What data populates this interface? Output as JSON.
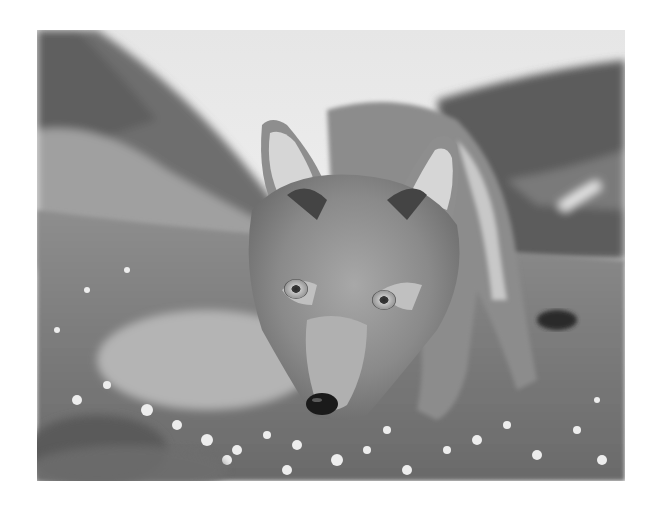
{
  "image": {
    "subject": "arctic fox",
    "alt": "Grayscale close-up photograph of an arctic fox in summer coat walking toward the camera through a meadow of small white flowers, with blurred hills and a bright sky behind",
    "style": "grayscale photograph",
    "colors": {
      "background": "#ffffff",
      "sky": "#f2f2f2",
      "hills_dark": "#5a5a5a",
      "hills_mid": "#8c8c8c",
      "meadow": "#7a7a7a",
      "fur_light": "#d0d0d0",
      "fur_mid": "#9a9a9a",
      "fur_dark": "#4a4a4a",
      "nose": "#1a1a1a",
      "eye": "#b8b8b8",
      "flowers": "#efefef"
    }
  }
}
